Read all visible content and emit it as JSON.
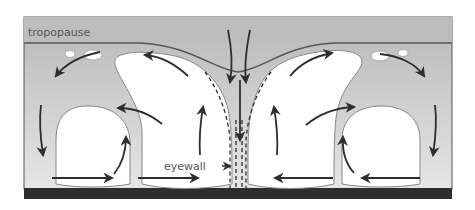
{
  "diagram": {
    "labels": {
      "tropopause": "tropopause",
      "eyewall": "eyewall"
    },
    "colors": {
      "background": "#c8c8c8",
      "clouds": "#ffffff",
      "ground": "#2e2e2e",
      "lines": "#3a3a3a",
      "label_text": "#555555"
    }
  }
}
